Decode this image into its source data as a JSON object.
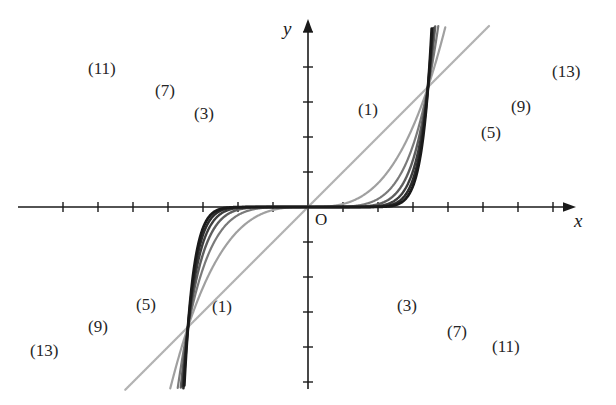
{
  "figure": {
    "title": "",
    "axis_x_label": "x",
    "axis_y_label": "y",
    "origin_label": "O",
    "background": "#ffffff"
  },
  "chart_data": {
    "type": "line",
    "title": "",
    "xlabel": "x",
    "ylabel": "y",
    "grid": false,
    "legend": "inline-curve-labels",
    "axes": {
      "origin_px": [
        308,
        207
      ],
      "tick_spacing_px": 35,
      "x_tick_count_left": 7,
      "x_tick_count_right": 7,
      "y_tick_count_up": 5,
      "y_tick_count_down": 5,
      "xlim": [
        -2.6,
        2.6
      ],
      "ylim": [
        -1.9,
        1.9
      ],
      "unit_px": 120
    },
    "series": [
      {
        "name": "(1)",
        "exponent": 1,
        "color": "#b3b3b3",
        "width": 2.2,
        "label_upper": {
          "text": "(1)",
          "x": 358,
          "y": 100
        },
        "label_lower": {
          "text": "(1)",
          "x": 212,
          "y": 297
        }
      },
      {
        "name": "(3)",
        "exponent": 3,
        "color": "#a0a0a0",
        "width": 2.2,
        "label_upper": {
          "text": "(3)",
          "x": 194,
          "y": 104
        },
        "label_lower": {
          "text": "(3)",
          "x": 397,
          "y": 296
        }
      },
      {
        "name": "(5)",
        "exponent": 5,
        "color": "#7a7a7a",
        "width": 2.2,
        "label_upper": {
          "text": "(5)",
          "x": 481,
          "y": 123
        },
        "label_lower": {
          "text": "(5)",
          "x": 136,
          "y": 295
        }
      },
      {
        "name": "(7)",
        "exponent": 7,
        "color": "#5e5e5e",
        "width": 2.4,
        "label_upper": {
          "text": "(7)",
          "x": 155,
          "y": 81
        },
        "label_lower": {
          "text": "(7)",
          "x": 447,
          "y": 322
        }
      },
      {
        "name": "(9)",
        "exponent": 9,
        "color": "#3d3d3d",
        "width": 2.4,
        "label_upper": {
          "text": "(9)",
          "x": 511,
          "y": 97
        },
        "label_lower": {
          "text": "(9)",
          "x": 88,
          "y": 317
        }
      },
      {
        "name": "(11)",
        "exponent": 11,
        "color": "#2b2b2b",
        "width": 2.6,
        "label_upper": {
          "text": "(11)",
          "x": 88,
          "y": 59
        },
        "label_lower": {
          "text": "(11)",
          "x": 492,
          "y": 337
        }
      },
      {
        "name": "(13)",
        "exponent": 13,
        "color": "#1a1a1a",
        "width": 2.8,
        "label_upper": {
          "text": "(13)",
          "x": 552,
          "y": 62
        },
        "label_lower": {
          "text": "(13)",
          "x": 30,
          "y": 341
        }
      }
    ]
  }
}
